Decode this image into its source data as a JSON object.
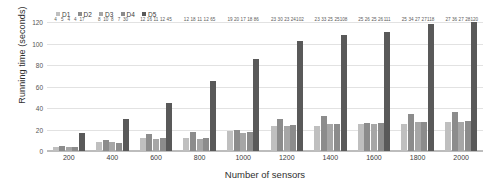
{
  "chart_data": {
    "type": "bar",
    "title": "",
    "xlabel": "Number of sensors",
    "ylabel": "Running time (seconds)",
    "ylim": [
      0,
      120
    ],
    "yticks": [
      0,
      20,
      40,
      60,
      80,
      100,
      120
    ],
    "grid": true,
    "legend_position": "top-left",
    "categories": [
      "200",
      "400",
      "600",
      "800",
      "1000",
      "1200",
      "1400",
      "1600",
      "1800",
      "2000"
    ],
    "series": [
      {
        "name": "D1",
        "color": "#bfbfbf",
        "values": [
          4,
          8,
          12,
          12,
          19,
          23,
          23,
          25,
          25,
          27
        ]
      },
      {
        "name": "D2",
        "color": "#8c8c8c",
        "values": [
          5,
          10,
          16,
          18,
          20,
          30,
          33,
          26,
          34,
          36
        ]
      },
      {
        "name": "D3",
        "color": "#a6a6a6",
        "values": [
          4,
          8,
          11,
          11,
          17,
          23,
          25,
          25,
          27,
          27
        ]
      },
      {
        "name": "D4",
        "color": "#8c8c8c",
        "values": [
          4,
          7,
          12,
          12,
          18,
          24,
          25,
          26,
          27,
          28
        ]
      },
      {
        "name": "D5",
        "color": "#595959",
        "values": [
          17,
          30,
          45,
          65,
          86,
          102,
          108,
          111,
          118,
          120
        ]
      }
    ]
  },
  "legend": {
    "items": [
      {
        "label": "D1"
      },
      {
        "label": "D2"
      },
      {
        "label": "D3"
      },
      {
        "label": "D4"
      },
      {
        "label": "D5"
      }
    ]
  }
}
